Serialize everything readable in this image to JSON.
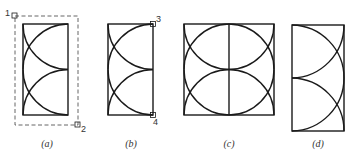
{
  "figure": {
    "panels": [
      {
        "id": "a",
        "caption": "(a)",
        "points": [
          {
            "label": "1"
          },
          {
            "label": "2"
          }
        ]
      },
      {
        "id": "b",
        "caption": "(b)",
        "points": [
          {
            "label": "3"
          },
          {
            "label": "4"
          }
        ]
      },
      {
        "id": "c",
        "caption": "(c)"
      },
      {
        "id": "d",
        "caption": "(d)"
      }
    ],
    "stroke_color": "#1a1a1a",
    "dash_color": "#555555"
  }
}
